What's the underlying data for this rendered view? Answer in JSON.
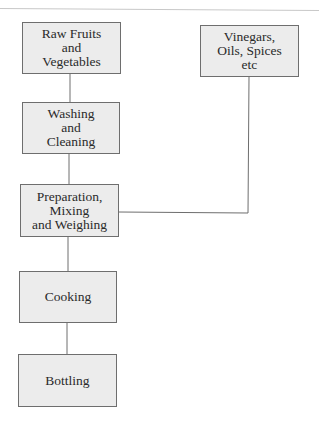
{
  "diagram": {
    "type": "process-flowchart",
    "nodes": [
      {
        "id": "raw",
        "label": "Raw Fruits\nand\nVegetables",
        "x": 22,
        "y": 22,
        "w": 99,
        "h": 52
      },
      {
        "id": "vinegars",
        "label": "Vinegars,\nOils, Spices\netc",
        "x": 200,
        "y": 25,
        "w": 99,
        "h": 52
      },
      {
        "id": "washing",
        "label": "Washing\nand\nCleaning",
        "x": 22,
        "y": 102,
        "w": 98,
        "h": 52
      },
      {
        "id": "preparation",
        "label": "Preparation,\nMixing\nand Weighing",
        "x": 20,
        "y": 184,
        "w": 99,
        "h": 53
      },
      {
        "id": "cooking",
        "label": "Cooking",
        "x": 19,
        "y": 271,
        "w": 98,
        "h": 52
      },
      {
        "id": "bottling",
        "label": "Bottling",
        "x": 18,
        "y": 354,
        "w": 99,
        "h": 53
      }
    ],
    "edges": [
      {
        "from": "raw",
        "to": "washing"
      },
      {
        "from": "washing",
        "to": "preparation"
      },
      {
        "from": "vinegars",
        "to": "preparation"
      },
      {
        "from": "preparation",
        "to": "cooking"
      },
      {
        "from": "cooking",
        "to": "bottling"
      }
    ],
    "colors": {
      "box_fill": "#ececec",
      "box_border": "#6e6e6e",
      "line": "#6e6e6e"
    }
  }
}
